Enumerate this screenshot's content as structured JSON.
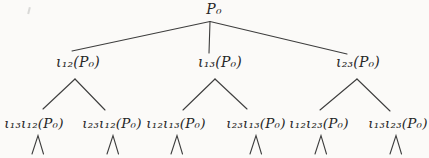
{
  "figure": {
    "type": "tree-diagram",
    "root": {
      "label": "P₀"
    },
    "level2": [
      {
        "label": "ι₁₂(P₀)"
      },
      {
        "label": "ι₁₃(P₀)"
      },
      {
        "label": "ι₂₃(P₀)"
      }
    ],
    "leaves": [
      {
        "label": "ι₁₃ι₁₂(P₀)"
      },
      {
        "label": "ι₂₃ι₁₂(P₀)"
      },
      {
        "label": "ι₁₂ι₁₃(P₀)"
      },
      {
        "label": "ι₂₃ι₁₃(P₀)"
      },
      {
        "label": "ι₁₂ι₂₃(P₀)"
      },
      {
        "label": "ι₁₃ι₂₃(P₀)"
      }
    ],
    "icons": {
      "continuation_wedge": "∧"
    },
    "colors": {
      "ink": "#262626",
      "edge": "#3d3d3d",
      "background": "#fbfaf8"
    }
  }
}
